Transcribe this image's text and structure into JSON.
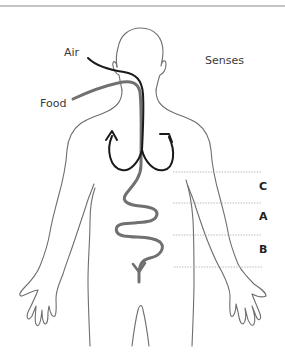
{
  "diagram": {
    "type": "human body outline with airway, digestive tract and labeled body zones",
    "labels": {
      "air": "Air",
      "food": "Food",
      "senses": "Senses"
    },
    "zones": [
      {
        "letter": "C",
        "order": 1
      },
      {
        "letter": "A",
        "order": 2
      },
      {
        "letter": "B",
        "order": 3
      }
    ],
    "colors": {
      "outline": "#6e6e6e",
      "air_path": "#1a1a1a",
      "food_path": "#707070",
      "divider": "#b5b5b5",
      "top_rule": "#8a8a8a"
    }
  }
}
